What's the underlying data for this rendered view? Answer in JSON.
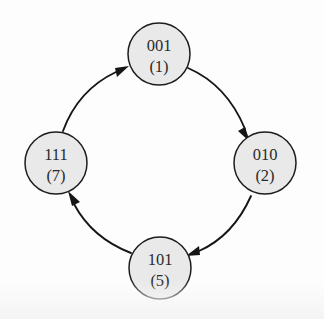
{
  "diagram": {
    "kind": "state-machine-cycle",
    "background_color": "#fdfdfd",
    "node_fill_color": "#e9e9e9",
    "node_stroke_color": "#1c1c1c",
    "edge_color": "#161616",
    "direction": "clockwise",
    "nodes": [
      {
        "id": "s1",
        "code": "001",
        "decimal": "(1)",
        "position": "top",
        "cx": 159,
        "cy": 54,
        "r": 31
      },
      {
        "id": "s2",
        "code": "010",
        "decimal": "(2)",
        "position": "right",
        "cx": 265,
        "cy": 163,
        "r": 31
      },
      {
        "id": "s5",
        "code": "101",
        "decimal": "(5)",
        "position": "bottom",
        "cx": 160,
        "cy": 268,
        "r": 31
      },
      {
        "id": "s7",
        "code": "111",
        "decimal": "(7)",
        "position": "left",
        "cx": 56,
        "cy": 163,
        "r": 31
      }
    ],
    "edges": [
      {
        "id": "e1",
        "from": "001",
        "to": "010",
        "label": "",
        "curve": "outward"
      },
      {
        "id": "e2",
        "from": "010",
        "to": "101",
        "label": "",
        "curve": "outward"
      },
      {
        "id": "e3",
        "from": "101",
        "to": "111",
        "label": "",
        "curve": "outward"
      },
      {
        "id": "e4",
        "from": "111",
        "to": "001",
        "label": "",
        "curve": "outward"
      }
    ],
    "cycle_sequence": "001 (1) → 010 (2) → 101 (5) → 111 (7) → 001 (1)"
  }
}
